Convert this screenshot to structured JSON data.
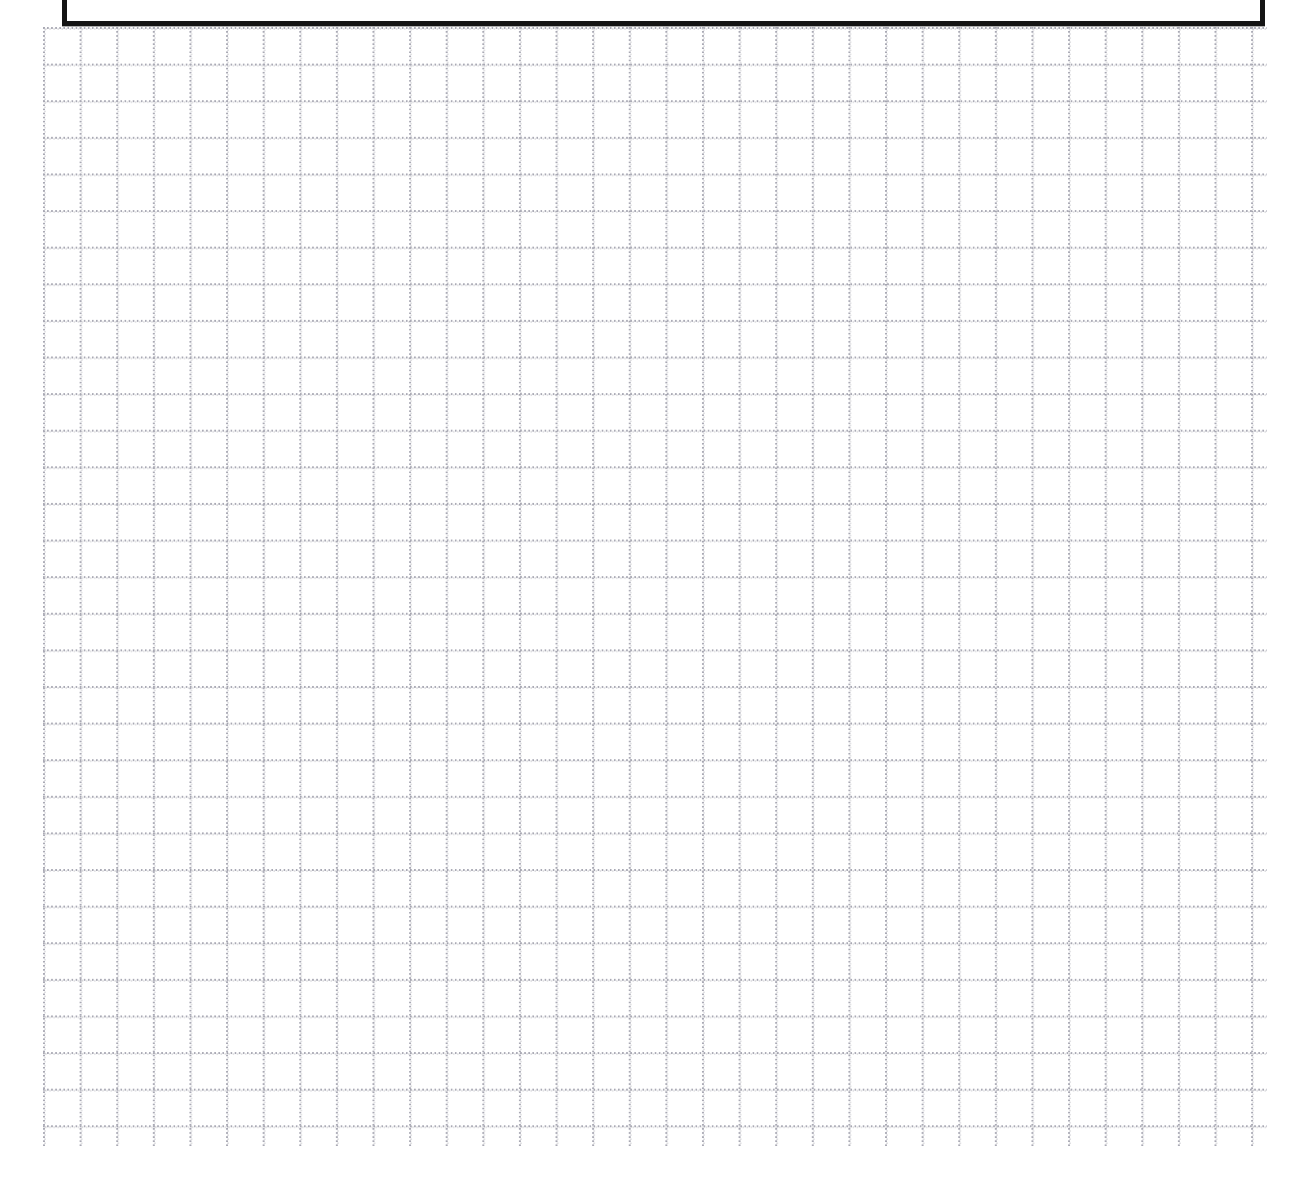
{
  "document": {
    "kind": "scanned-graph-paper-sheet",
    "page_width": 1310,
    "page_height": 1194,
    "background_color": "#ffffff",
    "caption": ""
  },
  "graph_grid": {
    "label": "",
    "line_style": "dotted",
    "line_color": "#a9a9b4",
    "cell_size_px": 37,
    "dot_spacing_px": 4,
    "left_px": 43,
    "top_px": 27,
    "right_px": 1266,
    "bottom_px": 1145,
    "columns": 34,
    "rows": 31
  },
  "form_box": {
    "label": "",
    "border_color": "#141414",
    "border_width_px": 5,
    "left_px": 62,
    "right_px": 1265,
    "bottom_px": 26,
    "clipped_at_top": true,
    "contents": ""
  },
  "artifacts": {
    "speck_label": ""
  }
}
